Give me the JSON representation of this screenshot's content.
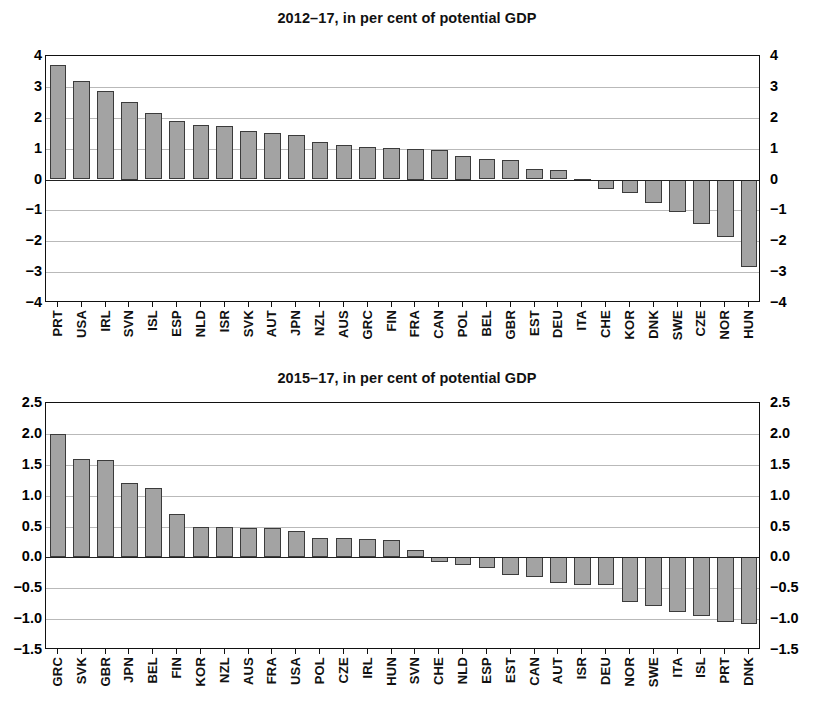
{
  "chart_data": [
    {
      "type": "bar",
      "title": "2012–17, in per cent of potential GDP",
      "xlabel": "",
      "ylabel": "",
      "ylim": [
        -4,
        4
      ],
      "yticks": [
        4,
        3,
        2,
        1,
        0,
        -1,
        -2,
        -3,
        -4
      ],
      "ytick_labels": [
        "4",
        "3",
        "2",
        "1",
        "0",
        "−1",
        "−2",
        "−3",
        "−4"
      ],
      "grid": true,
      "legend": "none",
      "bar_color": "#a3a3a3",
      "bar_edge_color": "#3b3b3b",
      "categories": [
        "PRT",
        "USA",
        "IRL",
        "SVN",
        "ISL",
        "ESP",
        "NLD",
        "ISR",
        "SVK",
        "AUT",
        "JPN",
        "NZL",
        "AUS",
        "GRC",
        "FIN",
        "FRA",
        "CAN",
        "POL",
        "BEL",
        "GBR",
        "EST",
        "DEU",
        "ITA",
        "CHE",
        "KOR",
        "DNK",
        "SWE",
        "CZE",
        "NOR",
        "HUN"
      ],
      "values": [
        3.7,
        3.2,
        2.87,
        2.5,
        2.15,
        1.9,
        1.78,
        1.73,
        1.57,
        1.52,
        1.45,
        1.23,
        1.12,
        1.05,
        1.03,
        1.0,
        0.95,
        0.75,
        0.67,
        0.62,
        0.33,
        0.3,
        0.02,
        -0.3,
        -0.45,
        -0.75,
        -1.05,
        -1.45,
        -1.85,
        -2.85
      ]
    },
    {
      "type": "bar",
      "title": "2015–17, in per cent of potential GDP",
      "xlabel": "",
      "ylabel": "",
      "ylim": [
        -1.5,
        2.5
      ],
      "yticks": [
        2.5,
        2.0,
        1.5,
        1.0,
        0.5,
        0.0,
        -0.5,
        -1.0,
        -1.5
      ],
      "ytick_labels": [
        "2.5",
        "2.0",
        "1.5",
        "1.0",
        "0.5",
        "0.0",
        "−0.5",
        "−1.0",
        "−1.5"
      ],
      "grid": true,
      "legend": "none",
      "bar_color": "#a3a3a3",
      "bar_edge_color": "#3b3b3b",
      "categories": [
        "GRC",
        "SVK",
        "GBR",
        "JPN",
        "BEL",
        "FIN",
        "KOR",
        "NZL",
        "AUS",
        "FRA",
        "USA",
        "POL",
        "CZE",
        "IRL",
        "HUN",
        "SVN",
        "CHE",
        "NLD",
        "ESP",
        "EST",
        "CAN",
        "AUT",
        "ISR",
        "DEU",
        "NOR",
        "SWE",
        "ITA",
        "ISL",
        "PRT",
        "DNK"
      ],
      "values": [
        2.0,
        1.6,
        1.58,
        1.2,
        1.12,
        0.7,
        0.5,
        0.5,
        0.48,
        0.47,
        0.42,
        0.32,
        0.31,
        0.3,
        0.28,
        0.12,
        -0.08,
        -0.13,
        -0.17,
        -0.28,
        -0.32,
        -0.42,
        -0.45,
        -0.45,
        -0.72,
        -0.78,
        -0.88,
        -0.95,
        -1.05,
        -1.08
      ]
    }
  ]
}
